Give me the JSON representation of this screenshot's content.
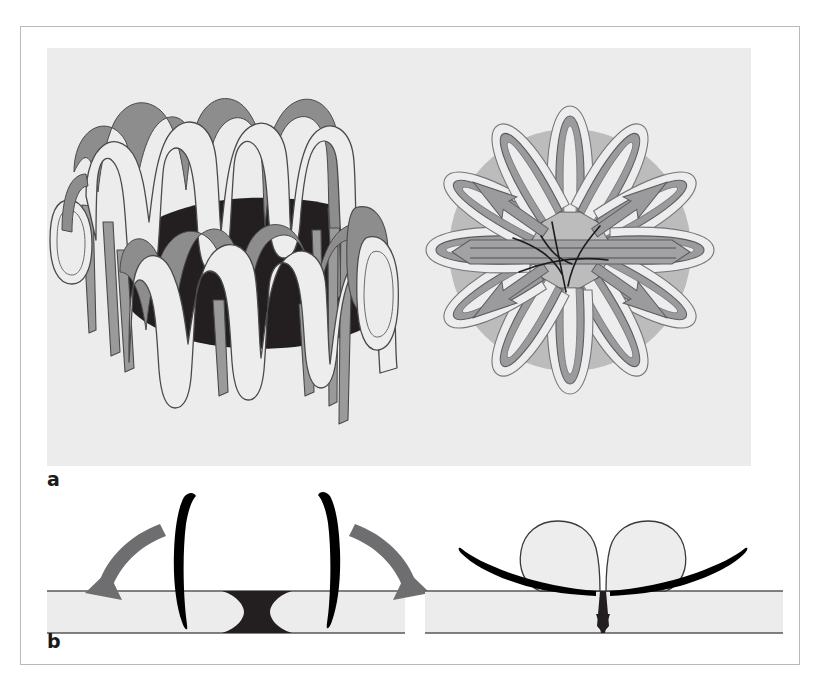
{
  "figure": {
    "type": "medical-device-illustration",
    "frame": {
      "x": 20,
      "y": 26,
      "width": 780,
      "height": 639,
      "border_color": "#b9b9b9",
      "background_color": "#ffffff"
    },
    "panels": [
      {
        "id": "a",
        "label": "a",
        "label_position": {
          "x": 47,
          "y": 470
        },
        "background_color": "#ececed",
        "region": {
          "x": 47,
          "y": 48,
          "width": 704,
          "height": 418
        },
        "views": [
          {
            "name": "side-perspective-view",
            "description": "Braided nitinol occluder seen obliquely from the side, showing two tiers of looped petals and a dark central lumen"
          },
          {
            "name": "top-en-face-view",
            "description": "Same occluder seen en face as a rosette of twelve petal loops over a translucent disc with central suture knot"
          }
        ]
      },
      {
        "id": "b",
        "label": "b",
        "label_position": {
          "x": 47,
          "y": 632
        },
        "background_color": "#ffffff",
        "region": {
          "x": 47,
          "y": 480,
          "width": 736,
          "height": 160
        },
        "views": [
          {
            "name": "deployment-step-1",
            "description": "Distal arms everting through the septal defect; curved arrows indicate the direction the arms fold outward against the septum"
          },
          {
            "name": "deployment-step-2",
            "description": "Device fully deployed, arms flattened on the septum and the two occluder bodies apposed across the closed defect"
          }
        ]
      }
    ],
    "colors": {
      "panel_background": "#ececed",
      "page_background": "#ffffff",
      "frame_border": "#b9b9b9",
      "ribbon_fill": "#ededee",
      "ribbon_shade": "#8d8d8e",
      "ribbon_outline": "#4a4a4a",
      "lumen_dark": "#231f20",
      "disc_translucent": "#a9a9aa",
      "septum_fill": "#ececed",
      "septum_outline": "#58585a",
      "arrow_gray": "#6e6e70",
      "arm_black": "#000000",
      "label_text": "#1a1a1a"
    },
    "geometry": {
      "side_view_petals_upper": 6,
      "side_view_petals_lower": 5,
      "enface_petals": 12,
      "step1_arrows": 2,
      "step2_bodies": 2,
      "step2_arms": 2
    }
  }
}
